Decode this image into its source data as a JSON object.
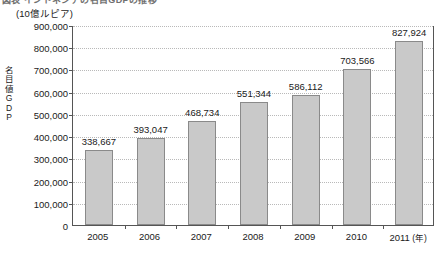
{
  "figure": {
    "clipped_title": "図表  インドネシアの名目GDPの推移",
    "unit_caption": "(10億ルピア)",
    "yaxis_title_chars": [
      "名",
      "目",
      "値",
      "G",
      "D",
      "P"
    ],
    "yaxis_title_text": "名目値GDP",
    "year_suffix": "(年)"
  },
  "style": {
    "bar_fill": "#c9c9c9",
    "bar_stroke": "#8a8a8a",
    "axis_color": "#555555",
    "grid_color": "#b9b9b9",
    "text_color": "#1a1a1a",
    "background": "#ffffff"
  },
  "chart_data": {
    "type": "bar",
    "title": "図表  インドネシアの名目GDPの推移",
    "xlabel": "(年)",
    "ylabel": "名目値GDP",
    "unit": "10億ルピア",
    "categories": [
      "2005",
      "2006",
      "2007",
      "2008",
      "2009",
      "2010",
      "2011"
    ],
    "values": [
      338667,
      393047,
      468734,
      551344,
      586112,
      703566,
      827924
    ],
    "value_labels": [
      "338,667",
      "393,047",
      "468,734",
      "551,344",
      "586,112",
      "703,566",
      "827,924"
    ],
    "ylim": [
      0,
      900000
    ],
    "ytick_step": 100000,
    "yticks": [
      0,
      100000,
      200000,
      300000,
      400000,
      500000,
      600000,
      700000,
      800000,
      900000
    ],
    "ytick_labels": [
      "0",
      "100,000",
      "200,000",
      "300,000",
      "400,000",
      "500,000",
      "600,000",
      "700,000",
      "800,000",
      "900,000"
    ],
    "grid": true,
    "grid_axis": "y",
    "legend": false,
    "legend_position": "none",
    "data_labels": true,
    "series": [
      {
        "name": "名目値GDP",
        "values": [
          338667,
          393047,
          468734,
          551344,
          586112,
          703566,
          827924
        ]
      }
    ]
  }
}
